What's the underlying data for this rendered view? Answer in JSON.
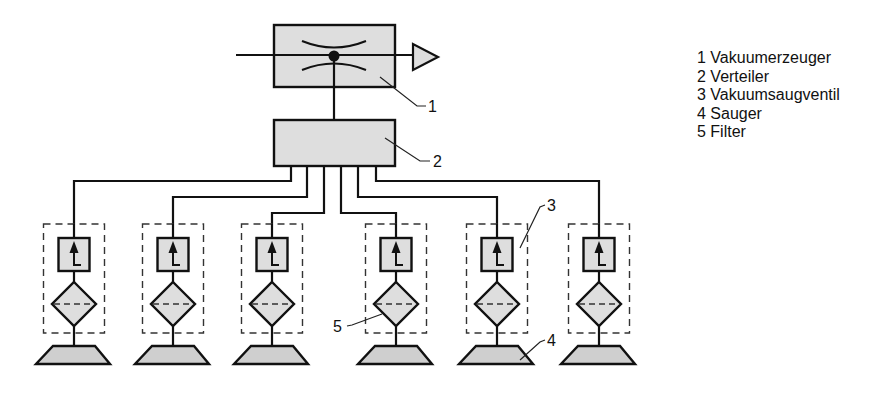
{
  "colors": {
    "fill": "#dedede",
    "stroke": "#111111",
    "background": "#ffffff"
  },
  "callouts": {
    "c1": "1",
    "c2": "2",
    "c3": "3",
    "c4": "4",
    "c5": "5"
  },
  "legend": {
    "items": [
      {
        "number": "1",
        "label": "Vakuumerzeuger",
        "text": "1 Vakuumerzeuger"
      },
      {
        "number": "2",
        "label": "Verteiler",
        "text": "2 Verteiler"
      },
      {
        "number": "3",
        "label": "Vakuumsaugventil",
        "text": "3 Vakuumsaugventil"
      },
      {
        "number": "4",
        "label": "Sauger",
        "text": "4 Sauger"
      },
      {
        "number": "5",
        "label": "Filter",
        "text": "5 Filter"
      }
    ]
  },
  "components": {
    "vacuum_generator": {
      "label_ref": "1",
      "icon": "ejector-nozzle-icon"
    },
    "distributor": {
      "label_ref": "2"
    },
    "branches": [
      {
        "index": 1,
        "center_x": 74
      },
      {
        "index": 2,
        "center_x": 173
      },
      {
        "index": 3,
        "center_x": 272
      },
      {
        "index": 4,
        "center_x": 396
      },
      {
        "index": 5,
        "center_x": 497
      },
      {
        "index": 6,
        "center_x": 599
      }
    ]
  }
}
